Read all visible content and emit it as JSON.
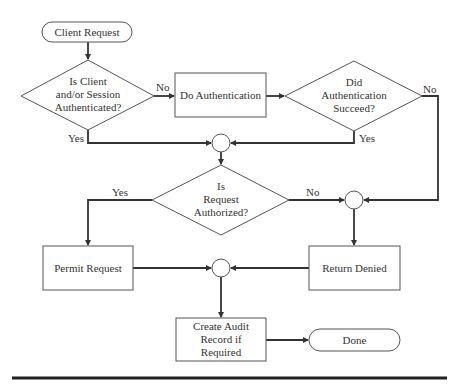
{
  "diagram": {
    "type": "flowchart",
    "nodes": {
      "start": {
        "kind": "terminator",
        "label": "Client Request"
      },
      "d_authenticated": {
        "kind": "decision",
        "lines": [
          "Is Client",
          "and/or Session",
          "Authenticated?"
        ]
      },
      "do_auth": {
        "kind": "process",
        "label": "Do Authentication"
      },
      "d_auth_succeed": {
        "kind": "decision",
        "lines": [
          "Did",
          "Authentication",
          "Succeed?"
        ]
      },
      "join1": {
        "kind": "connector"
      },
      "d_authorized": {
        "kind": "decision",
        "lines": [
          "Is",
          "Request",
          "Authorized?"
        ]
      },
      "join2": {
        "kind": "connector"
      },
      "permit": {
        "kind": "process",
        "label": "Permit Request"
      },
      "deny": {
        "kind": "process",
        "label": "Return Denied"
      },
      "join3": {
        "kind": "connector"
      },
      "audit": {
        "kind": "process",
        "lines": [
          "Create Audit",
          "Record if",
          "Required"
        ]
      },
      "done": {
        "kind": "terminator",
        "label": "Done"
      }
    },
    "edges": [
      {
        "from": "start",
        "to": "d_authenticated",
        "label": ""
      },
      {
        "from": "d_authenticated",
        "to": "do_auth",
        "label": "No"
      },
      {
        "from": "d_authenticated",
        "to": "join1",
        "label": "Yes"
      },
      {
        "from": "do_auth",
        "to": "d_auth_succeed",
        "label": ""
      },
      {
        "from": "d_auth_succeed",
        "to": "join1",
        "label": "Yes"
      },
      {
        "from": "d_auth_succeed",
        "to": "join2",
        "label": "No"
      },
      {
        "from": "join1",
        "to": "d_authorized",
        "label": ""
      },
      {
        "from": "d_authorized",
        "to": "permit",
        "label": "Yes"
      },
      {
        "from": "d_authorized",
        "to": "join2",
        "label": "No"
      },
      {
        "from": "join2",
        "to": "deny",
        "label": ""
      },
      {
        "from": "permit",
        "to": "join3",
        "label": ""
      },
      {
        "from": "deny",
        "to": "join3",
        "label": ""
      },
      {
        "from": "join3",
        "to": "audit",
        "label": ""
      },
      {
        "from": "audit",
        "to": "done",
        "label": ""
      }
    ],
    "edge_labels": {
      "d1_no": "No",
      "d1_yes": "Yes",
      "d2_no": "No",
      "d2_yes": "Yes",
      "d3_yes": "Yes",
      "d3_no": "No"
    }
  },
  "colors": {
    "line": "#333333",
    "shape_stroke": "#555555",
    "text": "#333333",
    "background": "#ffffff"
  }
}
